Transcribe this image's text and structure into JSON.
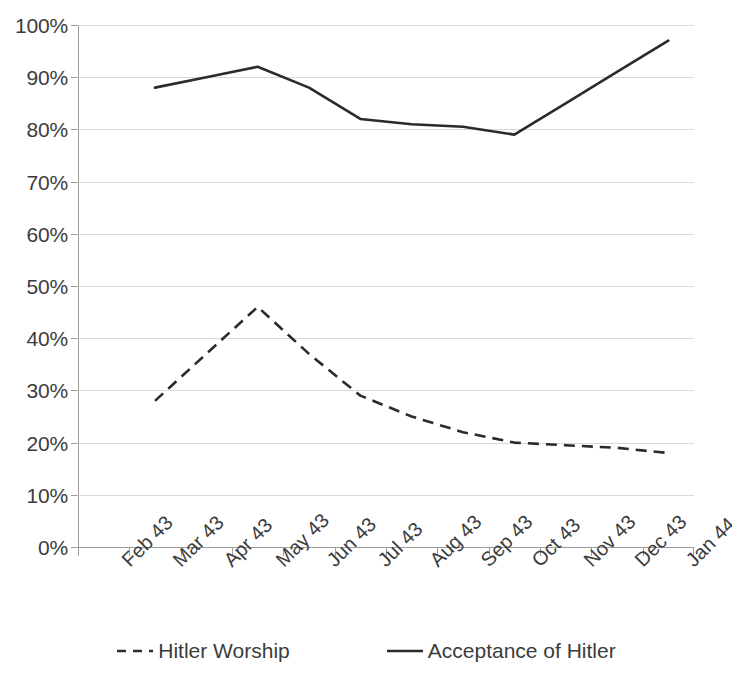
{
  "chart_data": {
    "type": "line",
    "title": "",
    "subtitle": "",
    "xlabel": "",
    "ylabel": "",
    "ylim": [
      0,
      100
    ],
    "yticks": [
      0,
      10,
      20,
      30,
      40,
      50,
      60,
      70,
      80,
      90,
      100
    ],
    "ytick_labels": [
      "0%",
      "10%",
      "20%",
      "30%",
      "40%",
      "50%",
      "60%",
      "70%",
      "80%",
      "90%",
      "100%"
    ],
    "grid": true,
    "legend_position": "bottom",
    "categories": [
      "Feb 43",
      "Mar 43",
      "Apr 43",
      "May 43",
      "Jun 43",
      "Jul 43",
      "Aug 43",
      "Sep 43",
      "Oct 43",
      "Nov 43",
      "Dec 43",
      "Jan 44"
    ],
    "series": [
      {
        "name": "Hitler Worship",
        "style": "dashed",
        "color": "#2b2b2b",
        "values": [
          null,
          28,
          37,
          46,
          37,
          29,
          25,
          22,
          20,
          19.5,
          19,
          18
        ]
      },
      {
        "name": "Acceptance of Hitler",
        "style": "solid",
        "color": "#2b2b2b",
        "values": [
          null,
          88,
          90,
          92,
          88,
          82,
          81,
          80.5,
          79,
          85,
          91,
          97
        ]
      }
    ]
  },
  "legend": {
    "items": [
      {
        "label": "Hitler Worship",
        "style": "dashed"
      },
      {
        "label": "Acceptance of Hitler",
        "style": "solid"
      }
    ]
  },
  "colors": {
    "series_line": "#2b2b2b",
    "gridline": "#d9d9d9",
    "axis": "#9c9c9c",
    "text": "#3c3c3c",
    "background": "#ffffff"
  }
}
